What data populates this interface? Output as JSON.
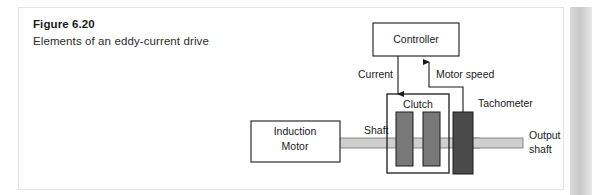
{
  "figure": {
    "number_label": "Figure 6.20",
    "caption": "Elements of an eddy-current drive"
  },
  "colors": {
    "page_background": "#ffffff",
    "card_border": "#e3e3e3",
    "page_edge_shadow": "#c9c9c9",
    "line": "#1a1a1a",
    "box_fill": "#ffffff",
    "shaft_fill": "#cfcfcf",
    "clutch_plate_fill": "#787878",
    "tachometer_fill": "#4a4a4a",
    "text": "#1a1a1a"
  },
  "diagram": {
    "type": "block-diagram",
    "blocks": [
      {
        "id": "controller",
        "label": "Controller",
        "style": "outline-box"
      },
      {
        "id": "clutch",
        "label": "Clutch",
        "style": "outline-box-with-plates"
      },
      {
        "id": "induction-motor",
        "label": "Induction\nMotor",
        "label_line1": "Induction",
        "label_line2": "Motor",
        "style": "outline-box"
      },
      {
        "id": "tachometer",
        "label": "Tachometer",
        "style": "dark-block"
      }
    ],
    "connectors": [
      {
        "id": "current",
        "label": "Current",
        "from": "controller",
        "to": "clutch",
        "arrow": "down"
      },
      {
        "id": "motor-speed",
        "label": "Motor speed",
        "from": "tachometer",
        "to": "controller",
        "arrow": "up"
      }
    ],
    "shafts": [
      {
        "id": "input-shaft",
        "label": "Shaft",
        "label_line1": "Shaft"
      },
      {
        "id": "output-shaft",
        "label": "Output shaft",
        "label_line1": "Output",
        "label_line2": "shaft"
      }
    ]
  }
}
